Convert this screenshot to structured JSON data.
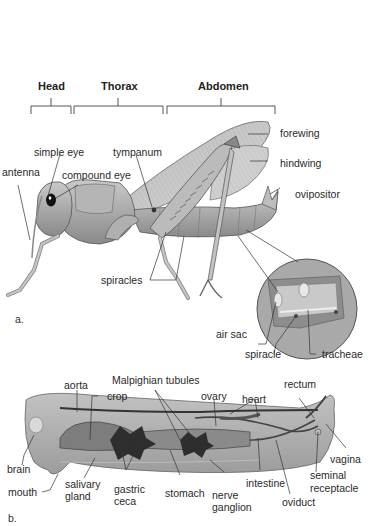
{
  "figure_a": {
    "panel_label": "a.",
    "regions": [
      {
        "name": "Head"
      },
      {
        "name": "Thorax"
      },
      {
        "name": "Abdomen"
      }
    ],
    "labels": {
      "simple_eye": "simple eye",
      "antenna": "antenna",
      "compound_eye": "compound eye",
      "tympanum": "tympanum",
      "forewing": "forewing",
      "hindwing": "hindwing",
      "ovipositor": "ovipositor",
      "spiracles": "spiracles",
      "air_sac": "air sac",
      "spiracle": "spiracle",
      "tracheae": "tracheae"
    }
  },
  "figure_b": {
    "panel_label": "b.",
    "labels": {
      "aorta": "aorta",
      "crop": "crop",
      "malpighian_tubules": "Malpighian tubules",
      "ovary": "ovary",
      "heart": "heart",
      "rectum": "rectum",
      "brain": "brain",
      "mouth": "mouth",
      "salivary_gland_1": "salivary",
      "salivary_gland_2": "gland",
      "gastric_ceca_1": "gastric",
      "gastric_ceca_2": "ceca",
      "stomach": "stomach",
      "nerve_ganglion_1": "nerve",
      "nerve_ganglion_2": "ganglion",
      "intestine": "intestine",
      "oviduct": "oviduct",
      "seminal_receptacle_1": "seminal",
      "seminal_receptacle_2": "receptacle",
      "vagina": "vagina"
    }
  },
  "colors": {
    "body_gray": "#9a9a9a",
    "dark_gray": "#3a3a3a",
    "light_gray": "#d4d4d4",
    "line": "#333333"
  }
}
